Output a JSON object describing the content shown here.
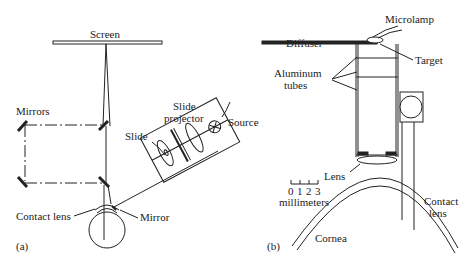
{
  "figure": {
    "panel_a": {
      "tag": "(a)",
      "labels": {
        "screen": "Screen",
        "mirrors": "Mirrors",
        "slide_projector_line1": "Slide",
        "slide_projector_line2": "projector",
        "source": "Source",
        "slide": "Slide",
        "contact_lens": "Contact lens",
        "mirror": "Mirror"
      }
    },
    "panel_b": {
      "tag": "(b)",
      "labels": {
        "microlamp": "Microlamp",
        "diffuser": "Diffuser",
        "target": "Target",
        "aluminum_tubes_line1": "Aluminum",
        "aluminum_tubes_line2": "tubes",
        "lens": "Lens",
        "contact_lens_line1": "Contact",
        "contact_lens_line2": "lens",
        "cornea": "Cornea"
      },
      "scale_bar": {
        "ticks": [
          "0",
          "1",
          "2",
          "3"
        ],
        "unit": "millimeters"
      }
    }
  },
  "colors": {
    "stroke": "#222222",
    "background": "#ffffff"
  }
}
